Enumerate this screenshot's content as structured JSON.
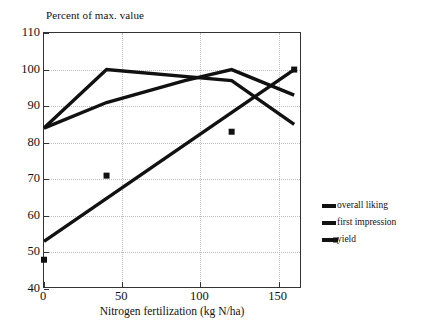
{
  "chart_data": {
    "type": "line",
    "title": "Percent of max. value",
    "xlabel": "Nitrogen fertilization (kg N/ha)",
    "ylabel": "",
    "xlim": [
      0,
      165
    ],
    "ylim": [
      40,
      110
    ],
    "xticks": [
      0,
      50,
      100,
      150
    ],
    "yticks": [
      40,
      50,
      60,
      70,
      80,
      90,
      100,
      110
    ],
    "xtick_labels": [
      "0",
      "50",
      "100",
      "150"
    ],
    "ytick_labels": [
      "40",
      "50",
      "60",
      "70",
      "80",
      "90",
      "100",
      "110"
    ],
    "grid": true,
    "grid_style": "dotted",
    "legend_position": "right-outside",
    "line_color": "#111111",
    "grid_color": "#bdbdbd",
    "axis_color": "#333333",
    "series": [
      {
        "name": "overall liking",
        "x": [
          0,
          40,
          120,
          160
        ],
        "values": [
          84,
          100,
          97,
          85
        ],
        "marker": "none"
      },
      {
        "name": "first impression",
        "x": [
          0,
          40,
          90,
          120,
          160
        ],
        "values": [
          84,
          91,
          97,
          100,
          93
        ],
        "marker": "none"
      },
      {
        "name": "yield",
        "x": [
          0,
          160
        ],
        "values": [
          53,
          100
        ],
        "marker": "square",
        "marker_points": {
          "x": [
            0,
            40,
            120,
            160
          ],
          "values": [
            48,
            71,
            83,
            100
          ]
        }
      }
    ]
  },
  "legend": {
    "items": [
      {
        "label": "overall liking",
        "swatch": "line-swatch",
        "marker": false
      },
      {
        "label": "first impression",
        "swatch": "line-swatch",
        "marker": false
      },
      {
        "label": "yield",
        "swatch": "line-swatch-marker",
        "marker": true
      }
    ]
  }
}
